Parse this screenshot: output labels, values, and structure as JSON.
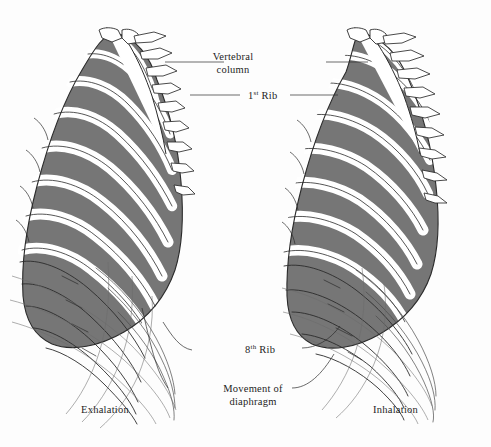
{
  "figure": {
    "background_color": "#fdfdfd",
    "bone_fill_color": "#ffffff",
    "intercostal_fill_color": "#767676",
    "outline_color": "#2b2b2b",
    "thin_line_color": "#555555",
    "text_color": "#1d1d1d"
  },
  "labels": {
    "vertebral_column": "Vertebral column",
    "vertebral_column_line1": "Vertebral",
    "vertebral_column_line2": "column",
    "first_rib_number": "1",
    "first_rib_ordinal": "st",
    "first_rib_word": "Rib",
    "eighth_rib_number": "8",
    "eighth_rib_ordinal": "th",
    "eighth_rib_word": "Rib",
    "movement_of_diaphragm": "Movement of diaphragm",
    "movement_line1": "Movement of",
    "movement_line2": "diaphragm",
    "exhalation": "Exhalation",
    "inhalation": "Inhalation"
  },
  "panels": [
    {
      "id": "left",
      "caption": "Exhalation",
      "description": "Rib cage in depressed, exhaled position with steeply angled ribs",
      "shaded_rib_pairs": 8,
      "outline_rib_pairs": 5
    },
    {
      "id": "right",
      "caption": "Inhalation",
      "description": "Rib cage in elevated, inhaled position with more horizontal ribs",
      "shaded_rib_pairs": 8,
      "outline_rib_pairs": 5
    }
  ],
  "leader_lines": [
    {
      "name": "vertebral-column-left",
      "from_label": "Vertebral column"
    },
    {
      "name": "vertebral-column-right",
      "from_label": "Vertebral column"
    },
    {
      "name": "first-rib-left",
      "from_label": "1st Rib"
    },
    {
      "name": "first-rib-right",
      "from_label": "1st Rib"
    },
    {
      "name": "eighth-rib-left",
      "from_label": "8th Rib"
    },
    {
      "name": "eighth-rib-right",
      "from_label": "8th Rib"
    },
    {
      "name": "diaphragm-left",
      "from_label": "Movement of diaphragm"
    },
    {
      "name": "diaphragm-right",
      "from_label": "Movement of diaphragm"
    }
  ]
}
